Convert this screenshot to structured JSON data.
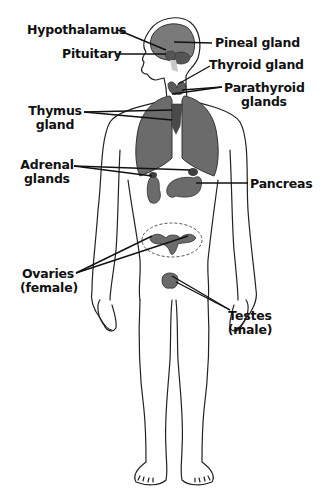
{
  "diagram": {
    "type": "anatomical-illustration",
    "colors": {
      "outline": "#222222",
      "organ_fill": "#6b6b6b",
      "organ_dark": "#4a4a4a",
      "brain_fill": "#7a7a7a",
      "leader_line": "#111111",
      "background": "#ffffff"
    },
    "labels": {
      "hypothalamus": "Hypothalamus",
      "pituitary": "Pituitary",
      "pineal": "Pineal gland",
      "thyroid": "Thyroid gland",
      "parathyroid_line1": "Parathyroid",
      "parathyroid_line2": "glands",
      "thymus_line1": "Thymus",
      "thymus_line2": "gland",
      "adrenal_line1": "Adrenal",
      "adrenal_line2": "glands",
      "pancreas": "Pancreas",
      "ovaries_line1": "Ovaries",
      "ovaries_line2": "(female)",
      "testes_line1": "Testes",
      "testes_line2": "(male)"
    }
  }
}
